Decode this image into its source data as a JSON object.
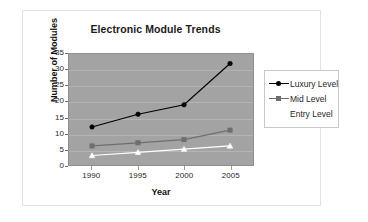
{
  "chart_data": {
    "type": "line",
    "title": "Electronic Module Trends",
    "xlabel": "Year",
    "ylabel": "Number of Modules",
    "categories": [
      "1990",
      "1995",
      "2000",
      "2005"
    ],
    "x": [
      1990,
      1995,
      2000,
      2005
    ],
    "xlim": [
      1987.5,
      2007.5
    ],
    "ylim": [
      0,
      35
    ],
    "yticks": [
      "0",
      "5",
      "10",
      "15",
      "20",
      "25",
      "30",
      "35"
    ],
    "grid": true,
    "legend_position": "right",
    "plot_background": "#a3a3a3",
    "series": [
      {
        "name": "Luxury Level",
        "values": [
          12,
          16,
          19,
          32
        ],
        "color": "#000000",
        "marker": "diamond"
      },
      {
        "name": "Mid Level",
        "values": [
          6,
          7,
          8,
          11
        ],
        "color": "#6e6e6e",
        "marker": "square"
      },
      {
        "name": "Entry Level",
        "values": [
          3,
          4,
          5,
          6
        ],
        "color": "#ffffff",
        "marker": "triangle"
      }
    ]
  },
  "legend": {
    "items": [
      {
        "label": "Luxury Level"
      },
      {
        "label": "Mid Level"
      },
      {
        "label": "Entry Level"
      }
    ]
  }
}
